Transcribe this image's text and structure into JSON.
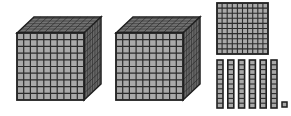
{
  "represented_value": 2161,
  "colors": {
    "face": "#a9a9a9",
    "top": "#8f8f8f",
    "side": "#7a7a7a",
    "grid": "#2b2b2b",
    "outline": "#1e1e1e"
  },
  "blocks": [
    {
      "type": "thousand-cube",
      "count": 2,
      "units_per_side": 10
    },
    {
      "type": "hundred-flat",
      "count": 1,
      "units_per_side": 10
    },
    {
      "type": "ten-rod",
      "count": 6,
      "units_long": 10
    },
    {
      "type": "unit-cube",
      "count": 1
    }
  ]
}
